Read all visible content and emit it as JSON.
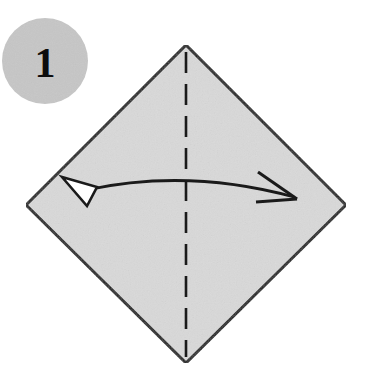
{
  "figure": {
    "kind": "origami-instruction-step",
    "canvas": {
      "width": 371,
      "height": 387
    },
    "background_color": "#ffffff"
  },
  "step_badge": {
    "label": "1",
    "shape": "circle",
    "fill_color": "#c6c6c6",
    "text_color": "#0d0d0d",
    "center_x": 45,
    "center_y": 61,
    "radius": 43
  },
  "paper": {
    "name": "square sheet rotated 45 degrees",
    "shape": "diamond",
    "fill_color": "#d9d9d9",
    "edge_color": "#1a1a1a",
    "edge_width": 3,
    "vertices": {
      "top": {
        "x": 186,
        "y": 45
      },
      "right": {
        "x": 346,
        "y": 205
      },
      "bottom": {
        "x": 186,
        "y": 363
      },
      "left": {
        "x": 26,
        "y": 205
      }
    }
  },
  "fold_line": {
    "name": "vertical valley fold crease",
    "style": "dashed",
    "color": "#1a1a1a",
    "width": 2.6,
    "dash_pattern": "21 11",
    "x": 186,
    "y_start": 52,
    "y_end": 357
  },
  "fold_arrow": {
    "name": "fold-and-unfold arc arrow",
    "color": "#1a1a1a",
    "stroke_width": 2.8,
    "path": "M 86 190 Q 188 168 294 197",
    "head_left": {
      "type": "solid-triangle",
      "fill": "#ffffff",
      "stroke": "#1a1a1a",
      "points": "62,177 97,187 87,206"
    },
    "head_right": {
      "type": "open-barb",
      "stroke": "#1a1a1a",
      "line_a": "258,172 297,199",
      "line_b": "256,202 297,199"
    }
  },
  "legend": {
    "fill_color": "#d9d9d9",
    "line_color": "#1a1a1a",
    "badge_color": "#c6c6c6"
  }
}
